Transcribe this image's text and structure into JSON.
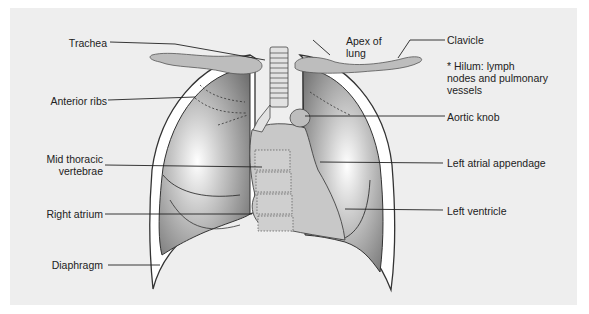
{
  "figure": {
    "background_color": "#eeeeee",
    "lung_color_dark": "#6f6f6f",
    "lung_color_light": "#ffffff",
    "soft_tissue_color": "#c8c8c8",
    "bone_color": "#b4b4b4"
  },
  "labels": {
    "left_side": [
      {
        "id": "trachea",
        "text": "Trachea"
      },
      {
        "id": "anterior_ribs",
        "text": "Anterior ribs"
      },
      {
        "id": "mid_thoracic_vertebrae_1",
        "text": "Mid thoracic"
      },
      {
        "id": "mid_thoracic_vertebrae_2",
        "text": "vertebrae"
      },
      {
        "id": "right_atrium",
        "text": "Right atrium"
      },
      {
        "id": "diaphragm",
        "text": "Diaphragm"
      }
    ],
    "top": [
      {
        "id": "apex_of_lung_1",
        "text": "Apex of"
      },
      {
        "id": "apex_of_lung_2",
        "text": "lung"
      }
    ],
    "right_side": [
      {
        "id": "clavicle",
        "text": "Clavicle"
      },
      {
        "id": "aortic_knob",
        "text": "Aortic knob"
      },
      {
        "id": "left_atrial_appendage",
        "text": "Left atrial appendage"
      },
      {
        "id": "left_ventricle",
        "text": "Left ventricle"
      }
    ],
    "note": "* Hilum: lymph\nnodes and pulmonary\nvessels"
  }
}
